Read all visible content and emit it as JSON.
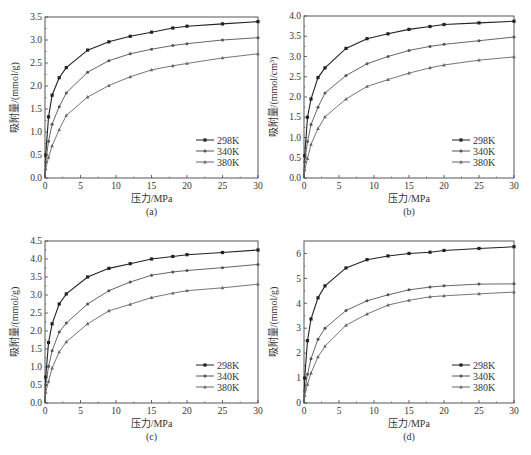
{
  "figure": {
    "caption": ""
  },
  "colors": {
    "s298": "#222222",
    "s340": "#555555",
    "s380": "#666666",
    "axis": "#444444"
  },
  "chart_data": [
    {
      "id": "a",
      "type": "line",
      "label": "(a)",
      "xlabel": "压力/MPa",
      "ylabel": "吸附量/(mmol/g)",
      "xlim": [
        0,
        30
      ],
      "ylim": [
        0,
        3.5
      ],
      "xticks": [
        0,
        5,
        10,
        15,
        20,
        25,
        30
      ],
      "yticks": [
        0.0,
        0.5,
        1.0,
        1.5,
        2.0,
        2.5,
        3.0,
        3.5
      ],
      "ytick_fmt": 1,
      "x": [
        0,
        0.1,
        0.5,
        1,
        2,
        3,
        6,
        9,
        12,
        15,
        18,
        20,
        25,
        30
      ],
      "series": [
        {
          "name": "298K",
          "marker": "square",
          "values": [
            0,
            0.5,
            1.33,
            1.8,
            2.18,
            2.4,
            2.78,
            2.96,
            3.08,
            3.17,
            3.26,
            3.3,
            3.35,
            3.4
          ]
        },
        {
          "name": "340K",
          "marker": "circle",
          "values": [
            0,
            0.35,
            0.8,
            1.17,
            1.55,
            1.85,
            2.3,
            2.55,
            2.7,
            2.8,
            2.88,
            2.92,
            3.0,
            3.05
          ]
        },
        {
          "name": "380K",
          "marker": "triangle",
          "values": [
            0,
            0.2,
            0.45,
            0.7,
            1.05,
            1.36,
            1.76,
            2.01,
            2.2,
            2.35,
            2.44,
            2.49,
            2.61,
            2.7
          ]
        }
      ],
      "legend_position": "lower right"
    },
    {
      "id": "b",
      "type": "line",
      "label": "(b)",
      "xlabel": "压力/MPa",
      "ylabel": "吸附量/(mmol/cm³)",
      "xlim": [
        0,
        30
      ],
      "ylim": [
        0,
        4.0
      ],
      "xticks": [
        0,
        5,
        10,
        15,
        20,
        25,
        30
      ],
      "yticks": [
        0.0,
        0.5,
        1.0,
        1.5,
        2.0,
        2.5,
        3.0,
        3.5,
        4.0
      ],
      "ytick_fmt": 1,
      "x": [
        0,
        0.1,
        0.5,
        1,
        2,
        3,
        6,
        9,
        12,
        15,
        18,
        20,
        25,
        30
      ],
      "series": [
        {
          "name": "298K",
          "marker": "square",
          "values": [
            0,
            0.55,
            1.5,
            1.95,
            2.48,
            2.72,
            3.2,
            3.44,
            3.56,
            3.67,
            3.74,
            3.79,
            3.83,
            3.87
          ]
        },
        {
          "name": "340K",
          "marker": "circle",
          "values": [
            0,
            0.4,
            0.9,
            1.32,
            1.75,
            2.1,
            2.53,
            2.82,
            3.0,
            3.15,
            3.25,
            3.3,
            3.39,
            3.48
          ]
        },
        {
          "name": "380K",
          "marker": "triangle",
          "values": [
            0,
            0.2,
            0.48,
            0.83,
            1.22,
            1.51,
            1.95,
            2.26,
            2.43,
            2.59,
            2.72,
            2.79,
            2.91,
            2.99
          ]
        }
      ],
      "legend_position": "lower right"
    },
    {
      "id": "c",
      "type": "line",
      "label": "(c)",
      "xlabel": "压力/MPa",
      "ylabel": "吸附量/(mmol/g)",
      "xlim": [
        0,
        30
      ],
      "ylim": [
        0,
        4.5
      ],
      "xticks": [
        0,
        5,
        10,
        15,
        20,
        25,
        30
      ],
      "yticks": [
        0.0,
        0.5,
        1.0,
        1.5,
        2.0,
        2.5,
        3.0,
        3.5,
        4.0,
        4.5
      ],
      "ytick_fmt": 1,
      "x": [
        0,
        0.1,
        0.5,
        1,
        2,
        3,
        6,
        9,
        12,
        15,
        18,
        20,
        25,
        30
      ],
      "series": [
        {
          "name": "298K",
          "marker": "square",
          "values": [
            0,
            0.72,
            1.68,
            2.2,
            2.75,
            3.03,
            3.5,
            3.74,
            3.87,
            4.0,
            4.07,
            4.12,
            4.18,
            4.25
          ]
        },
        {
          "name": "340K",
          "marker": "circle",
          "values": [
            0,
            0.5,
            1.02,
            1.45,
            1.97,
            2.22,
            2.75,
            3.12,
            3.36,
            3.55,
            3.64,
            3.68,
            3.76,
            3.85
          ]
        },
        {
          "name": "380K",
          "marker": "triangle",
          "values": [
            0,
            0.3,
            0.6,
            0.97,
            1.42,
            1.7,
            2.2,
            2.56,
            2.74,
            2.93,
            3.05,
            3.12,
            3.2,
            3.3
          ]
        }
      ],
      "legend_position": "lower right"
    },
    {
      "id": "d",
      "type": "line",
      "label": "(d)",
      "xlabel": "压力/MPa",
      "ylabel": "吸附量/(mmol/g)",
      "xlim": [
        0,
        30
      ],
      "ylim": [
        0,
        6.5
      ],
      "xticks": [
        0,
        5,
        10,
        15,
        20,
        25,
        30
      ],
      "yticks": [
        0,
        1,
        2,
        3,
        4,
        5,
        6
      ],
      "ytick_fmt": 0,
      "x": [
        0,
        0.1,
        0.5,
        1,
        2,
        3,
        6,
        9,
        12,
        15,
        18,
        20,
        25,
        30
      ],
      "series": [
        {
          "name": "298K",
          "marker": "square",
          "values": [
            0,
            1.0,
            2.5,
            3.37,
            4.22,
            4.7,
            5.42,
            5.75,
            5.9,
            6.0,
            6.05,
            6.12,
            6.2,
            6.27
          ]
        },
        {
          "name": "340K",
          "marker": "circle",
          "values": [
            0,
            0.5,
            1.15,
            1.78,
            2.56,
            3.0,
            3.71,
            4.1,
            4.34,
            4.54,
            4.65,
            4.7,
            4.77,
            4.78
          ]
        },
        {
          "name": "380K",
          "marker": "triangle",
          "values": [
            0,
            0.3,
            0.75,
            1.2,
            1.85,
            2.28,
            3.12,
            3.57,
            3.93,
            4.12,
            4.26,
            4.3,
            4.38,
            4.45
          ]
        }
      ],
      "legend_position": "lower right"
    }
  ]
}
